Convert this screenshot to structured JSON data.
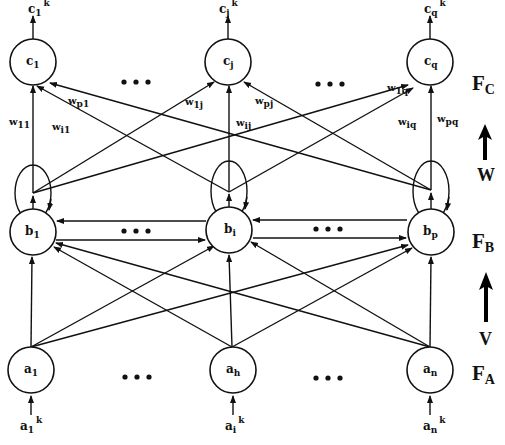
{
  "layers": {
    "c": {
      "label": "F",
      "label_sub": "C",
      "nodes": [
        {
          "base": "c",
          "sub": "1",
          "out_base": "c",
          "out_sub": "1",
          "out_sup": "k"
        },
        {
          "base": "c",
          "sub": "j",
          "out_base": "c",
          "out_sub": "j",
          "out_sup": "k"
        },
        {
          "base": "c",
          "sub": "q",
          "out_base": "c",
          "out_sub": "q",
          "out_sup": "k"
        }
      ]
    },
    "b": {
      "label": "F",
      "label_sub": "B",
      "nodes": [
        {
          "base": "b",
          "sub": "1"
        },
        {
          "base": "b",
          "sub": "i"
        },
        {
          "base": "b",
          "sub": "p"
        }
      ]
    },
    "a": {
      "label": "F",
      "label_sub": "A",
      "nodes": [
        {
          "base": "a",
          "sub": "1",
          "in_base": "a",
          "in_sub": "1",
          "in_sup": "k"
        },
        {
          "base": "a",
          "sub": "h",
          "in_base": "a",
          "in_sub": "i",
          "in_sup": "k"
        },
        {
          "base": "a",
          "sub": "n",
          "in_base": "a",
          "in_sub": "n",
          "in_sup": "k"
        }
      ]
    }
  },
  "weights": {
    "w11": {
      "base": "w",
      "sub": "11"
    },
    "wi1": {
      "base": "w",
      "sub": "i1"
    },
    "wp1": {
      "base": "w",
      "sub": "p1"
    },
    "w1j": {
      "base": "w",
      "sub": "1j"
    },
    "wij": {
      "base": "w",
      "sub": "ij"
    },
    "wpj": {
      "base": "w",
      "sub": "pj"
    },
    "w1q": {
      "base": "w",
      "sub": "1q"
    },
    "wiq": {
      "base": "w",
      "sub": "iq"
    },
    "wpq": {
      "base": "w",
      "sub": "pq"
    }
  },
  "matrices": {
    "W": "W",
    "V": "V"
  },
  "ellipsis": "..."
}
